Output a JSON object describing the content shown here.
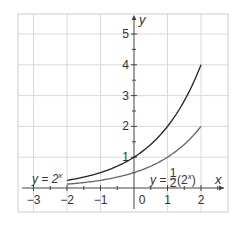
{
  "chart_data": {
    "type": "line",
    "title": "",
    "xlabel": "x",
    "ylabel": "y",
    "xlim": [
      -3.5,
      2.8
    ],
    "ylim": [
      -0.8,
      5.6
    ],
    "grid": true,
    "x_ticks": [
      -3,
      -2,
      -1,
      0,
      1,
      2
    ],
    "x_tick_labels": [
      "−3",
      "−2",
      "−1",
      "0",
      "1",
      "2"
    ],
    "y_ticks": [
      1,
      2,
      3,
      4,
      5
    ],
    "y_tick_labels": [
      "1",
      "2",
      "3",
      "4",
      "5"
    ],
    "minor_tick_step": 0.5,
    "series": [
      {
        "name": "y = 2^x",
        "label_text": "y = 2",
        "label_sup": "x",
        "color": "#222222",
        "domain": [
          -2,
          2
        ],
        "x": [
          -2,
          -1.5,
          -1,
          -0.5,
          0,
          0.5,
          1,
          1.5,
          2
        ],
        "values": [
          0.25,
          0.354,
          0.5,
          0.707,
          1,
          1.414,
          2,
          2.828,
          4
        ]
      },
      {
        "name": "y = 1/2(2^x)",
        "label_text": "y = ",
        "label_frac_num": "1",
        "label_frac_den": "2",
        "label_paren": "(2",
        "label_sup": "x",
        "label_close": ")",
        "color": "#666666",
        "domain": [
          -2,
          2
        ],
        "x": [
          -2,
          -1.5,
          -1,
          -0.5,
          0,
          0.5,
          1,
          1.5,
          2
        ],
        "values": [
          0.125,
          0.177,
          0.25,
          0.354,
          0.5,
          0.707,
          1,
          1.414,
          2
        ]
      }
    ],
    "legend": "inline labels",
    "annotations": []
  }
}
